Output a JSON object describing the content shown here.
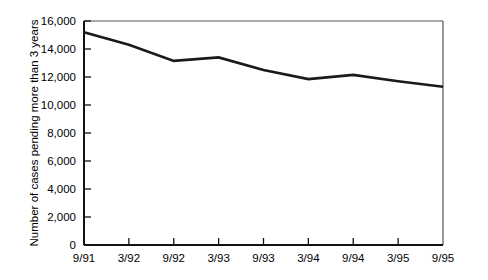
{
  "chart_data": {
    "type": "line",
    "title": "",
    "xlabel": "",
    "ylabel": "Number of cases pending more than 3 years",
    "categories": [
      "9/91",
      "3/92",
      "9/92",
      "3/93",
      "9/93",
      "3/94",
      "9/94",
      "3/95",
      "9/95"
    ],
    "values": [
      15200,
      14300,
      13150,
      13400,
      12500,
      11850,
      12150,
      11700,
      11300
    ],
    "ylim": [
      0,
      16000
    ],
    "ytick_values": [
      0,
      2000,
      4000,
      6000,
      8000,
      10000,
      12000,
      14000,
      16000
    ],
    "ytick_labels": [
      "0",
      "2,000",
      "4,000",
      "6,000",
      "8,000",
      "10,000",
      "12,000",
      "14,000",
      "16,000"
    ],
    "grid": false,
    "legend": "none",
    "line_color": "#1a1a1a",
    "frame_color": "#555555",
    "background_color": "#ffffff"
  }
}
